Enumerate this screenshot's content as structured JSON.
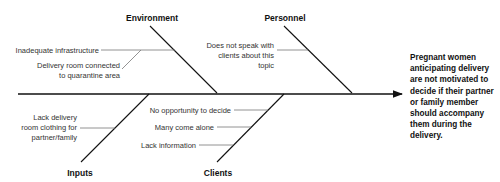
{
  "diagram": {
    "type": "fishbone",
    "effect": "Pregnant women anticipating delivery are not motivated to decide if their partner or family member should accompany them during the delivery.",
    "categories": {
      "environment": {
        "label": "Environment",
        "causes": [
          "Inadequate infrastructure",
          "Delivery room connected",
          "to quarantine area"
        ]
      },
      "personnel": {
        "label": "Personnel",
        "causes": [
          "Does not speak with",
          "clients about this",
          "topic"
        ]
      },
      "inputs": {
        "label": "Inputs",
        "causes": [
          "Lack delivery",
          "room clothing for",
          "partner/family"
        ]
      },
      "clients": {
        "label": "Clients",
        "causes": [
          "No opportunity to decide",
          "Many come alone",
          "Lack information"
        ]
      }
    },
    "colors": {
      "line": "#111111",
      "sub_line": "#666666",
      "text": "#333333"
    }
  }
}
